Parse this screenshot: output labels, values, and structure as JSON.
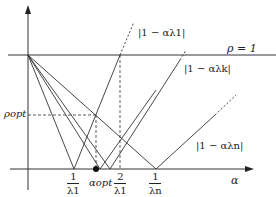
{
  "axes": {
    "x_label": "α",
    "y_label": ""
  },
  "labels": {
    "rho_one": "ρ = 1",
    "rho_opt": "ρopt",
    "curve_1": "|1 − αλ1|",
    "curve_k": "|1 − αλk|",
    "curve_n": "|1 − αλn|",
    "alpha_opt": "αopt"
  },
  "ticks": [
    {
      "num": "1",
      "den": "λ1"
    },
    {
      "num": "2",
      "den": "λ1"
    },
    {
      "num": "1",
      "den": "λn"
    }
  ]
}
